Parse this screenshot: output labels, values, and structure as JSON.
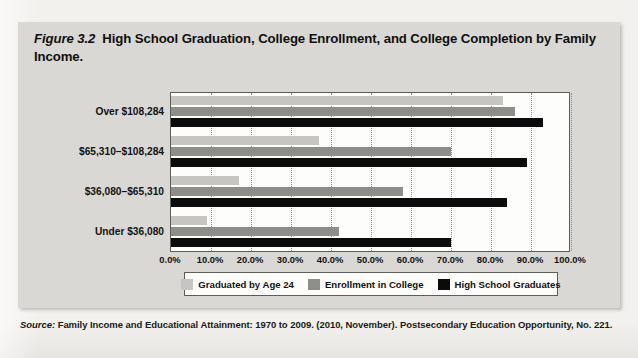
{
  "figure": {
    "number_label": "Figure 3.2",
    "caption": "High School Graduation, College Enrollment, and College Completion by Family Income."
  },
  "source": {
    "label": "Source:",
    "text": "Family Income and Educational Attainment: 1970 to 2009. (2010, November). Postsecondary Education Opportunity, No. 221."
  },
  "colors": {
    "series_graduated": "#c6c5c1",
    "series_enrollment": "#8d8d89",
    "series_high_school": "#0b0b0b",
    "panel_background": "#d9d8d4",
    "plot_background": "#fdfdfc",
    "axis_line": "#5d5d5a"
  },
  "chart_data": {
    "type": "bar",
    "orientation": "horizontal",
    "title": "High School Graduation, College Enrollment, and College Completion by Family Income.",
    "xlabel": "",
    "ylabel": "",
    "xlim": [
      0,
      100
    ],
    "xtick_labels": [
      "0.0%",
      "10.0%",
      "20.0%",
      "30.0%",
      "40.0%",
      "50.0%",
      "60.0%",
      "70.0%",
      "80.0%",
      "90.0%",
      "100.0%"
    ],
    "xticks": [
      0,
      10,
      20,
      30,
      40,
      50,
      60,
      70,
      80,
      90,
      100
    ],
    "grid": true,
    "legend_position": "bottom",
    "categories": [
      "Over $108,284",
      "$65,310–$108,284",
      "$36,080–$65,310",
      "Under $36,080"
    ],
    "series": [
      {
        "name": "Graduated by Age 24",
        "color": "#c6c5c1",
        "values": [
          83,
          37,
          17,
          9
        ]
      },
      {
        "name": "Enrollment in College",
        "color": "#8d8d89",
        "values": [
          86,
          70,
          58,
          42
        ]
      },
      {
        "name": "High School Graduates",
        "color": "#0b0b0b",
        "values": [
          93,
          89,
          84,
          70
        ]
      }
    ]
  }
}
